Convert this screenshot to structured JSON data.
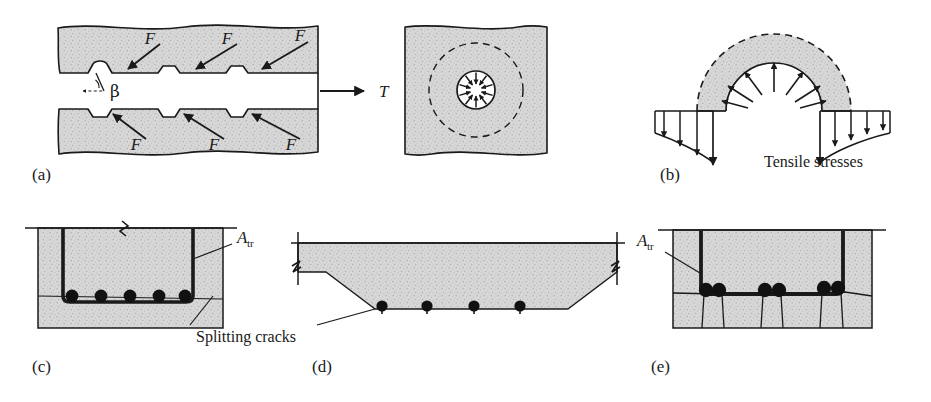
{
  "figure": {
    "panels": [
      {
        "id": "a",
        "label": "(a)",
        "description": "Deformed bar embedded in concrete with bearing forces on lugs",
        "force_labels": [
          "F",
          "F",
          "F",
          "F",
          "F",
          "F"
        ],
        "angle_label": "β",
        "tension_label": "T"
      },
      {
        "id": "a2",
        "label": "",
        "description": "Cross section of bar showing radial bond forces and splitting zone",
        "tension_label": "T"
      },
      {
        "id": "b",
        "label": "(b)",
        "description": "Free body of concrete ring showing radial and tensile stresses",
        "stress_label": "Tensile stresses"
      },
      {
        "id": "c",
        "label": "(c)",
        "description": "Beam section with stirrup and bottom bars, horizontal side splitting",
        "area_label": "A",
        "area_sub": "tr"
      },
      {
        "id": "d",
        "label": "(d)",
        "description": "Wide slab section showing face and side splitting cracks",
        "crack_label": "Splitting cracks"
      },
      {
        "id": "e",
        "label": "(e)",
        "description": "Beam section with bundled bars and vertical splitting cracks",
        "area_label": "A",
        "area_sub": "tr"
      }
    ],
    "colors": {
      "concrete_fill": "#d6d6d6",
      "concrete_speckle": "#b9b9b9",
      "line": "#1a1a1a",
      "rebar": "#111111",
      "background": "#ffffff"
    }
  }
}
